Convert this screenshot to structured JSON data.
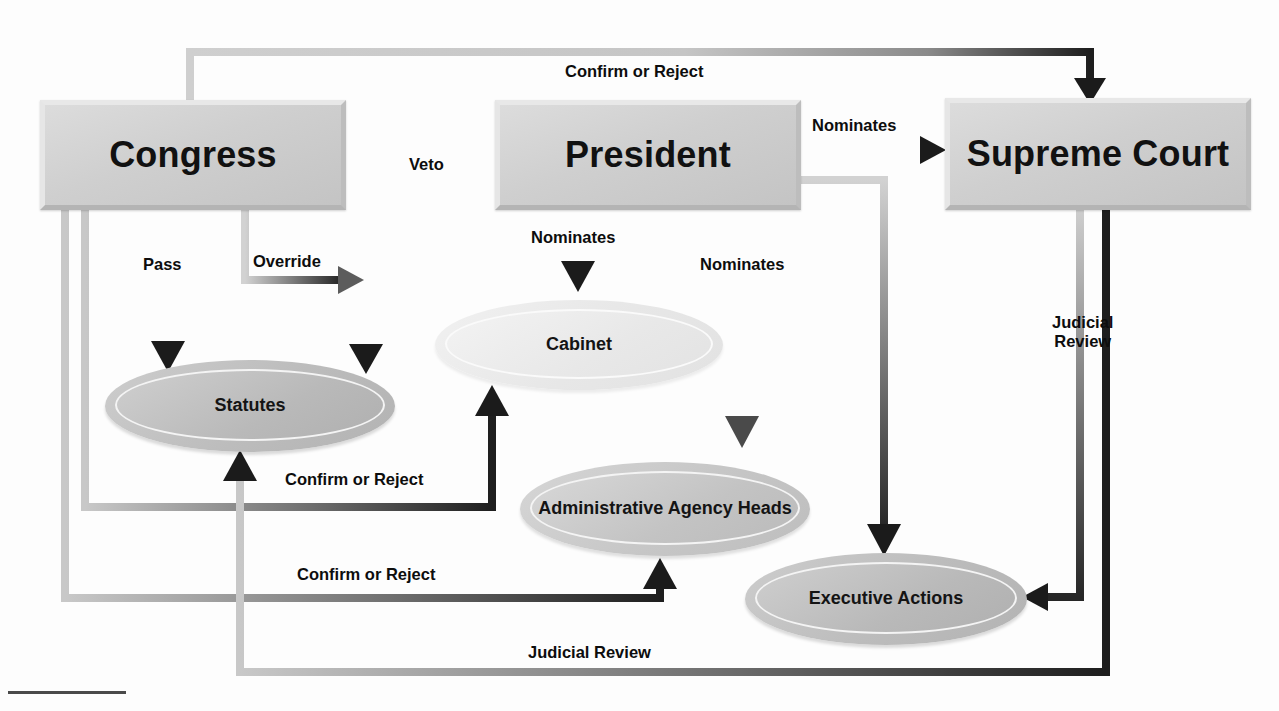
{
  "diagram": {
    "nodes": [
      {
        "id": "congress",
        "label": "Congress",
        "shape": "box",
        "x": 40,
        "y": 100,
        "w": 296,
        "h": 100
      },
      {
        "id": "president",
        "label": "President",
        "shape": "box",
        "x": 495,
        "y": 100,
        "w": 296,
        "h": 100
      },
      {
        "id": "supreme",
        "label": "Supreme Court",
        "shape": "box",
        "x": 945,
        "y": 98,
        "w": 296,
        "h": 102
      },
      {
        "id": "statutes",
        "label": "Statutes",
        "shape": "ellipse",
        "tone": "dark",
        "x": 105,
        "y": 360,
        "w": 290,
        "h": 92
      },
      {
        "id": "cabinet",
        "label": "Cabinet",
        "shape": "ellipse",
        "tone": "light",
        "x": 435,
        "y": 300,
        "w": 288,
        "h": 90
      },
      {
        "id": "agencies",
        "label": "Administrative\nAgency Heads",
        "shape": "ellipse",
        "tone": "mid",
        "x": 520,
        "y": 462,
        "w": 290,
        "h": 94
      },
      {
        "id": "executive",
        "label": "Executive Actions",
        "shape": "ellipse",
        "tone": "dark",
        "x": 745,
        "y": 553,
        "w": 282,
        "h": 92
      }
    ],
    "edges": [
      {
        "id": "congress-confirm-supreme",
        "label": "Confirm or Reject",
        "from": "congress",
        "to": "supreme",
        "label_x": 565,
        "label_y": 62,
        "tone": "light-to-dark"
      },
      {
        "id": "president-nominates-supreme",
        "label": "Nominates",
        "from": "president",
        "to": "supreme",
        "label_x": 812,
        "label_y": 116,
        "tone": "light-to-dark"
      },
      {
        "id": "president-veto-statutes",
        "label": "Veto",
        "from": "president",
        "to": "statutes",
        "label_x": 409,
        "label_y": 155,
        "tone": "light-to-dark"
      },
      {
        "id": "congress-pass-statutes",
        "label": "Pass",
        "from": "congress",
        "to": "statutes",
        "label_x": 143,
        "label_y": 255,
        "tone": "light-to-dark"
      },
      {
        "id": "congress-override-statutes",
        "label": "Override",
        "from": "congress",
        "to": "statutes",
        "label_x": 253,
        "label_y": 252,
        "tone": "light-to-dark"
      },
      {
        "id": "president-nominates-cabinet",
        "label": "Nominates",
        "from": "president",
        "to": "cabinet",
        "label_x": 531,
        "label_y": 228,
        "tone": "light-to-dark"
      },
      {
        "id": "president-nominates-agency",
        "label": "Nominates",
        "from": "president",
        "to": "agencies",
        "label_x": 700,
        "label_y": 255,
        "tone": "light-to-dark"
      },
      {
        "id": "congress-confirm-cabinet",
        "label": "Confirm or Reject",
        "from": "congress",
        "to": "cabinet",
        "label_x": 285,
        "label_y": 470,
        "tone": "light-to-dark"
      },
      {
        "id": "congress-confirm-agency",
        "label": "Confirm or Reject",
        "from": "congress",
        "to": "agencies",
        "label_x": 297,
        "label_y": 565,
        "tone": "light-to-dark"
      },
      {
        "id": "supreme-review-executive",
        "label": "Judicial\nReview",
        "from": "supreme",
        "to": "executive",
        "label_x": 1052,
        "label_y": 313,
        "tone": "light-to-dark"
      },
      {
        "id": "supreme-review-statutes",
        "label": "Judicial Review",
        "from": "supreme",
        "to": "statutes",
        "label_x": 528,
        "label_y": 643,
        "tone": "light-to-dark"
      }
    ],
    "colors": {
      "wire_light": "#c9c9c9",
      "wire_dark": "#2b2b2b",
      "node_fill_dark": "#bcbcbc",
      "node_fill_light": "#ececec",
      "text": "#111111",
      "background": "#ffffff"
    }
  }
}
